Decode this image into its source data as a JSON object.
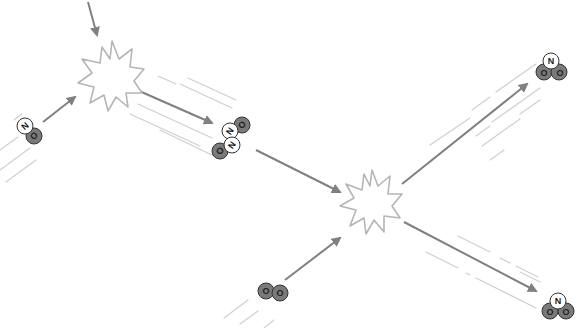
{
  "diagram": {
    "title": "",
    "type": "molecular collision / reaction diagram",
    "colors": {
      "background": "#ffffff",
      "arrow": "#808080",
      "motion_lines": "#c8c8c8",
      "burst_outline": "#b5b5b5",
      "oxygen_atom": "#7a7a7a",
      "nitrogen_atom": "#ffffff",
      "atom_outline": "#333333"
    },
    "collisions": [
      {
        "id": "collision-1",
        "label": "",
        "x": 112,
        "y": 79
      },
      {
        "id": "collision-2",
        "label": "",
        "x": 372,
        "y": 204
      }
    ],
    "molecules": [
      {
        "id": "no-left",
        "formula": "NO",
        "atoms": [
          {
            "symbol": "N",
            "x": 25,
            "y": 126
          },
          {
            "symbol": "O",
            "x": 34,
            "y": 136
          }
        ]
      },
      {
        "id": "n2o2-dimer",
        "formula": "N2O2",
        "atoms": [
          {
            "symbol": "O",
            "x": 242,
            "y": 125
          },
          {
            "symbol": "N",
            "x": 230,
            "y": 131
          },
          {
            "symbol": "N",
            "x": 232,
            "y": 145
          },
          {
            "symbol": "O",
            "x": 220,
            "y": 151
          }
        ]
      },
      {
        "id": "o2-bottom",
        "formula": "O2",
        "atoms": [
          {
            "symbol": "O",
            "x": 266,
            "y": 291
          },
          {
            "symbol": "O",
            "x": 280,
            "y": 293
          }
        ]
      },
      {
        "id": "no2-top-right",
        "formula": "NO2",
        "atoms": [
          {
            "symbol": "N",
            "x": 551,
            "y": 61
          },
          {
            "symbol": "O",
            "x": 544,
            "y": 72
          },
          {
            "symbol": "O",
            "x": 559,
            "y": 72
          }
        ]
      },
      {
        "id": "no2-bottom-right",
        "formula": "NO2",
        "atoms": [
          {
            "symbol": "N",
            "x": 558,
            "y": 301
          },
          {
            "symbol": "O",
            "x": 550,
            "y": 311
          },
          {
            "symbol": "O",
            "x": 566,
            "y": 311
          }
        ]
      }
    ],
    "arrows": [
      {
        "id": "arrow-incoming-top",
        "x1": 88,
        "y1": 2,
        "x2": 97,
        "y2": 35
      },
      {
        "id": "arrow-no-to-collision-1",
        "x1": 43,
        "y1": 122,
        "x2": 75,
        "y2": 97
      },
      {
        "id": "arrow-collision-1-to-dimer",
        "x1": 137,
        "y1": 90,
        "x2": 212,
        "y2": 123
      },
      {
        "id": "arrow-dimer-to-collision-2",
        "x1": 256,
        "y1": 150,
        "x2": 340,
        "y2": 192
      },
      {
        "id": "arrow-o2-to-collision-2",
        "x1": 285,
        "y1": 280,
        "x2": 340,
        "y2": 238
      },
      {
        "id": "arrow-collision-2-to-no2-top",
        "x1": 402,
        "y1": 184,
        "x2": 527,
        "y2": 84
      },
      {
        "id": "arrow-collision-2-to-no2-bottom",
        "x1": 404,
        "y1": 222,
        "x2": 536,
        "y2": 291
      }
    ]
  }
}
